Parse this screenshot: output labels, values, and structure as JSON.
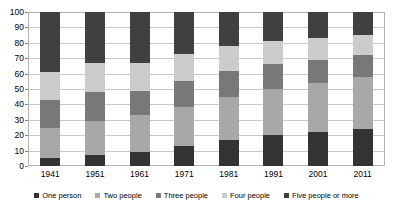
{
  "chart_data": {
    "type": "bar",
    "stacked": true,
    "title": "",
    "subtitle": "",
    "xlabel": "",
    "ylabel": "",
    "ylim": [
      0,
      100
    ],
    "yticks": [
      0,
      10,
      20,
      30,
      40,
      50,
      60,
      70,
      80,
      90,
      100
    ],
    "ytick_labels": [
      "0",
      "10",
      "20",
      "30",
      "40",
      "50",
      "60",
      "70",
      "80",
      "90",
      "100"
    ],
    "grid": true,
    "legend_position": "bottom",
    "categories": [
      "1941",
      "1951",
      "1961",
      "1971",
      "1981",
      "1991",
      "2001",
      "2011"
    ],
    "series": [
      {
        "name": "One person",
        "color": "#333333",
        "values": [
          5,
          7,
          9,
          13,
          17,
          20,
          22,
          24
        ]
      },
      {
        "name": "Two people",
        "color": "#a8a8a8",
        "values": [
          20,
          22,
          24,
          25,
          28,
          30,
          32,
          34
        ]
      },
      {
        "name": "Three people",
        "color": "#787878",
        "values": [
          18,
          19,
          16,
          17,
          17,
          16,
          15,
          14
        ]
      },
      {
        "name": "Four people",
        "color": "#cccccc",
        "values": [
          18,
          19,
          18,
          18,
          16,
          15,
          14,
          13
        ]
      },
      {
        "name": "Five people or more",
        "color": "#404040",
        "values": [
          39,
          33,
          33,
          27,
          22,
          19,
          17,
          15
        ]
      }
    ],
    "cumulative_tops": [
      [
        5,
        25,
        43,
        61,
        100
      ],
      [
        7,
        29,
        48,
        67,
        100
      ],
      [
        9,
        33,
        49,
        67,
        100
      ],
      [
        13,
        38,
        55,
        73,
        100
      ],
      [
        17,
        45,
        62,
        78,
        100
      ],
      [
        20,
        50,
        66,
        81,
        100
      ],
      [
        22,
        54,
        69,
        83,
        100
      ],
      [
        24,
        58,
        72,
        85,
        100
      ]
    ]
  },
  "axis": {
    "y_tick_labels": [
      "100",
      "90",
      "80",
      "70",
      "60",
      "50",
      "40",
      "30",
      "20",
      "10",
      "0"
    ],
    "x_tick_labels": [
      "1941",
      "1951",
      "1961",
      "1971",
      "1981",
      "1991",
      "2001",
      "2011"
    ]
  },
  "legend": {
    "items": [
      {
        "label": "One person",
        "color": "#333333"
      },
      {
        "label": "Two people",
        "color": "#a8a8a8"
      },
      {
        "label": "Three people",
        "color": "#787878"
      },
      {
        "label": "Four people",
        "color": "#cccccc"
      },
      {
        "label": "Five people or more",
        "color": "#404040"
      }
    ]
  },
  "colors": {
    "plot_background": "#ffffff",
    "grid": "#c8c8c8",
    "border": "#b3b3b3",
    "text": "#000000"
  }
}
